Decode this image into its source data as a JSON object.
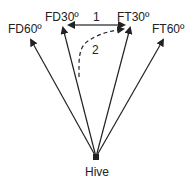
{
  "diagram": {
    "origin_label": "Hive",
    "targets": [
      {
        "id": "fd60",
        "label": "FD60º"
      },
      {
        "id": "fd30",
        "label": "FD30º"
      },
      {
        "id": "ft30",
        "label": "FT30º"
      },
      {
        "id": "ft60",
        "label": "FT60º"
      }
    ],
    "paths": [
      {
        "id": "path-1",
        "label": "1",
        "style": "solid double-headed",
        "from": "FD30º",
        "to": "FT30º"
      },
      {
        "id": "path-2",
        "label": "2",
        "style": "dashed",
        "from": "Hive direction",
        "to": "FT30º"
      }
    ],
    "colors": {
      "line": "#222222",
      "background": "#ffffff"
    }
  }
}
